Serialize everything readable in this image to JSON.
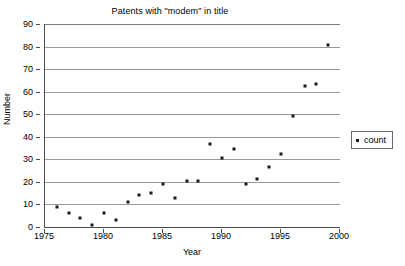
{
  "chart_data": {
    "type": "scatter",
    "title": "Patents with \"modem\" in title",
    "xlabel": "Year",
    "ylabel": "Number",
    "xlim": [
      1975,
      2000
    ],
    "ylim": [
      0,
      90
    ],
    "x_tick_step": 5,
    "y_tick_step": 10,
    "grid": "horizontal",
    "legend_position": "right",
    "x_ticks": [
      "1975",
      "1980",
      "1985",
      "1990",
      "1995",
      "2000"
    ],
    "x_tick_values": [
      1975,
      1980,
      1985,
      1990,
      1995,
      2000
    ],
    "y_ticks": [
      "0",
      "10",
      "20",
      "30",
      "40",
      "50",
      "60",
      "70",
      "80",
      "90"
    ],
    "y_tick_values": [
      0,
      10,
      20,
      30,
      40,
      50,
      60,
      70,
      80,
      90
    ],
    "series": [
      {
        "name": "count",
        "marker": "dot",
        "color": "#1a1a1a",
        "x": [
          1976,
          1977,
          1978,
          1979,
          1980,
          1981,
          1982,
          1983,
          1984,
          1985,
          1986,
          1987,
          1988,
          1989,
          1990,
          1991,
          1992,
          1993,
          1994,
          1995,
          1996,
          1997,
          1998,
          1999
        ],
        "values": [
          9,
          6,
          4,
          1,
          6,
          3,
          11,
          14,
          15,
          19,
          13,
          20.5,
          20.5,
          37,
          30.5,
          34.5,
          19,
          21.5,
          26.5,
          32.5,
          49,
          62.5,
          63.5,
          80.5
        ]
      }
    ]
  },
  "legend": {
    "entries": [
      {
        "label": "count"
      }
    ]
  }
}
